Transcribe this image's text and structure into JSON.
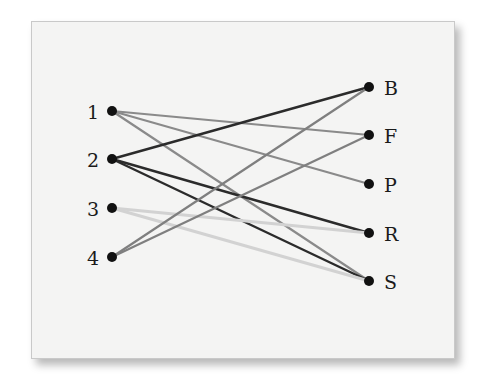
{
  "diagram": {
    "type": "bipartite-graph",
    "left_nodes": [
      {
        "id": "1",
        "label": "1",
        "x": 112,
        "y": 111
      },
      {
        "id": "2",
        "label": "2",
        "x": 112,
        "y": 159
      },
      {
        "id": "3",
        "label": "3",
        "x": 112,
        "y": 208
      },
      {
        "id": "4",
        "label": "4",
        "x": 112,
        "y": 257
      }
    ],
    "right_nodes": [
      {
        "id": "B",
        "label": "B",
        "x": 369,
        "y": 87
      },
      {
        "id": "F",
        "label": "F",
        "x": 369,
        "y": 135
      },
      {
        "id": "P",
        "label": "P",
        "x": 369,
        "y": 184
      },
      {
        "id": "R",
        "label": "R",
        "x": 369,
        "y": 233
      },
      {
        "id": "S",
        "label": "S",
        "x": 369,
        "y": 281
      }
    ],
    "edges": [
      {
        "from": "1",
        "to": "F",
        "color": "#8a8a8a",
        "width": 2.2
      },
      {
        "from": "1",
        "to": "P",
        "color": "#8a8a8a",
        "width": 2.2
      },
      {
        "from": "1",
        "to": "S",
        "color": "#8a8a8a",
        "width": 2.2
      },
      {
        "from": "2",
        "to": "B",
        "color": "#2b2b2b",
        "width": 2.4
      },
      {
        "from": "2",
        "to": "R",
        "color": "#2b2b2b",
        "width": 2.4
      },
      {
        "from": "2",
        "to": "S",
        "color": "#2b2b2b",
        "width": 2.4
      },
      {
        "from": "3",
        "to": "R",
        "color": "#d2d2d2",
        "width": 3
      },
      {
        "from": "3",
        "to": "S",
        "color": "#d2d2d2",
        "width": 3
      },
      {
        "from": "4",
        "to": "B",
        "color": "#7f7f7f",
        "width": 2.2
      },
      {
        "from": "4",
        "to": "F",
        "color": "#7f7f7f",
        "width": 2.2
      }
    ],
    "node_color": "#111111",
    "node_radius": 5
  }
}
